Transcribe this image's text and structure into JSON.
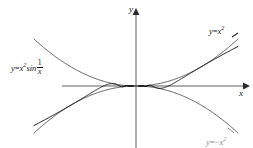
{
  "figure": {
    "background_color": "#ffffff",
    "ink_color": "#1a1a1a",
    "faint_color": "#8c8c8c"
  },
  "axes": {
    "y_label": "y",
    "x_label": "x",
    "origin_px": [
      136,
      86
    ],
    "x_axis_start_px": [
      62,
      86
    ],
    "x_axis_end_px": [
      246,
      86
    ],
    "y_axis_top_px": [
      136,
      12
    ],
    "y_axis_bottom_px": [
      136,
      148
    ],
    "arrowheads": [
      "x-positive",
      "y-positive"
    ],
    "ticks": "none",
    "gridlines": "none"
  },
  "labels": {
    "oscillating": {
      "lhs": "y",
      "equals": "=",
      "base": "x",
      "exponent": "2",
      "func": "sin",
      "frac_numerator": "1",
      "frac_denominator": "x",
      "plain": "y = x2 sin 1/x"
    },
    "upper_envelope": {
      "lhs": "y",
      "equals": "=",
      "base": "x",
      "exponent": "2",
      "plain": "y = x2"
    },
    "lower_envelope": {
      "lhs": "y",
      "equals": "=",
      "sign": "−",
      "base": "x",
      "exponent": "2",
      "plain": "y = -x2"
    }
  },
  "chart_data": {
    "type": "line",
    "title": "",
    "xlabel": "x",
    "ylabel": "y",
    "xlim": [
      -1.0,
      1.0
    ],
    "ylim": [
      -1.0,
      1.0
    ],
    "grid": false,
    "legend": "inline-annotations",
    "series": [
      {
        "name": "y = x^2",
        "role": "upper-envelope",
        "expression": "x^2",
        "color": "#4d4d4d",
        "linewidth": 0.9,
        "domain": [
          -1.0,
          1.0
        ],
        "x": [
          -1.0,
          -0.9,
          -0.8,
          -0.7,
          -0.6,
          -0.5,
          -0.4,
          -0.3,
          -0.2,
          -0.1,
          0.0,
          0.1,
          0.2,
          0.3,
          0.4,
          0.5,
          0.6,
          0.7,
          0.8,
          0.9,
          1.0
        ],
        "y": [
          1.0,
          0.81,
          0.64,
          0.49,
          0.36,
          0.25,
          0.16,
          0.09,
          0.04,
          0.01,
          0.0,
          0.01,
          0.04,
          0.09,
          0.16,
          0.25,
          0.36,
          0.49,
          0.64,
          0.81,
          1.0
        ]
      },
      {
        "name": "y = -x^2",
        "role": "lower-envelope",
        "expression": "-x^2",
        "color": "#4d4d4d",
        "linewidth": 0.9,
        "domain": [
          -1.0,
          1.0
        ],
        "x": [
          -1.0,
          -0.9,
          -0.8,
          -0.7,
          -0.6,
          -0.5,
          -0.4,
          -0.3,
          -0.2,
          -0.1,
          0.0,
          0.1,
          0.2,
          0.3,
          0.4,
          0.5,
          0.6,
          0.7,
          0.8,
          0.9,
          1.0
        ],
        "y": [
          -1.0,
          -0.81,
          -0.64,
          -0.49,
          -0.36,
          -0.25,
          -0.16,
          -0.09,
          -0.04,
          -0.01,
          0.0,
          -0.01,
          -0.04,
          -0.09,
          -0.16,
          -0.25,
          -0.36,
          -0.49,
          -0.64,
          -0.81,
          -1.0
        ]
      },
      {
        "name": "y = x^2 sin(1/x)",
        "role": "oscillating-curve",
        "expression": "x^2*sin(1/x)",
        "color": "#111111",
        "linewidth": 1.0,
        "domain": [
          -1.0,
          1.0
        ],
        "samples": 4000,
        "note": "oscillates infinitely often near x = 0, touching both envelopes"
      }
    ]
  }
}
